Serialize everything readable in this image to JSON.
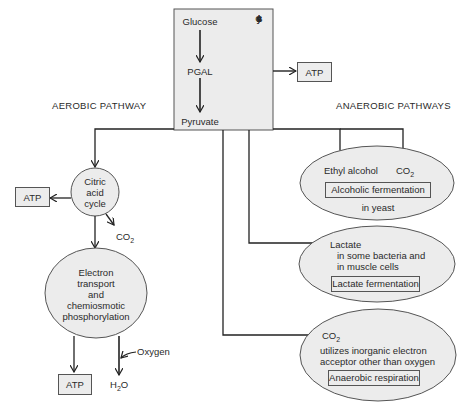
{
  "glycolysis": {
    "steps": [
      "Glucose",
      "PGAL",
      "Pyruvate"
    ],
    "label_letters": [
      "G",
      "l",
      "y",
      "c",
      "o",
      "l",
      "y",
      "s",
      "i",
      "s"
    ],
    "atp": "ATP"
  },
  "aerobic": {
    "heading": "AEROBIC PATHWAY",
    "citric_cycle": [
      "Citric",
      "acid",
      "cycle"
    ],
    "citric_atp": "ATP",
    "citric_co2": "CO",
    "citric_co2_sub": "2",
    "electron_transport": [
      "Electron",
      "transport",
      "and",
      "chemiosmotic",
      "phosphorylation"
    ],
    "et_atp": "ATP",
    "oxygen": "Oxygen",
    "water": "H",
    "water_sub": "2",
    "water_tail": "O"
  },
  "anaerobic": {
    "heading": "ANAEROBIC PATHWAYS",
    "alcoholic": {
      "product1": "Ethyl alcohol",
      "product2": "CO",
      "product2_sub": "2",
      "title": "Alcoholic fermentation",
      "note": "in yeast"
    },
    "lactate": {
      "product": "Lactate",
      "note1": "in some bacteria and",
      "note2": "in muscle cells",
      "title": "Lactate fermentation"
    },
    "respiration": {
      "product": "CO",
      "product_sub": "2",
      "note1": "utilizes inorganic electron",
      "note2": "acceptor other than oxygen",
      "title": "Anaerobic respiration"
    }
  }
}
